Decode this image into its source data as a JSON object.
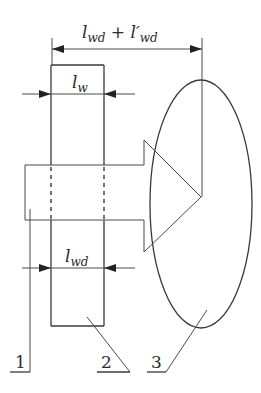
{
  "diagram": {
    "dimensions": {
      "total": {
        "base": "l",
        "sub": "wd",
        "plus": " + ",
        "base2": "l′",
        "sub2": "wd"
      },
      "width": {
        "base": "l",
        "sub": "w"
      },
      "welded_width": {
        "base": "l",
        "sub": "wd"
      }
    },
    "parts": [
      {
        "label": "1",
        "description": "shaft-arrow body"
      },
      {
        "label": "2",
        "description": "plate / rectangle"
      },
      {
        "label": "3",
        "description": "ellipse zone"
      }
    ],
    "colors": {
      "stroke": "#3a3a3a",
      "background": "#ffffff"
    }
  }
}
